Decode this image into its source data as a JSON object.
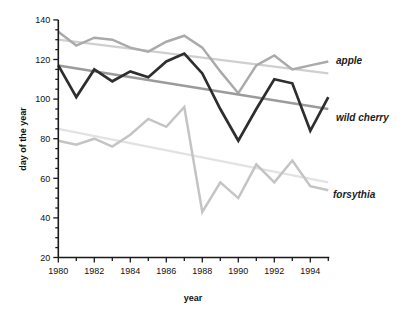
{
  "chart_data": {
    "type": "line",
    "x": [
      1980,
      1981,
      1982,
      1983,
      1984,
      1985,
      1986,
      1987,
      1988,
      1989,
      1990,
      1991,
      1992,
      1993,
      1994,
      1995
    ],
    "x_axis": {
      "label": "year",
      "range": [
        1980,
        1995
      ],
      "minor_tick_step": 1,
      "labeled_ticks": [
        1980,
        1982,
        1984,
        1986,
        1988,
        1990,
        1992,
        1994
      ],
      "tick_labels": [
        "1980",
        "1982",
        "1984",
        "1986",
        "1988",
        "1990",
        "1992",
        "1994"
      ]
    },
    "y_axis": {
      "label": "day of the year",
      "range": [
        20,
        140
      ],
      "major_tick_step": 20,
      "minor_tick_step": 5,
      "labeled_ticks": [
        20,
        40,
        60,
        80,
        100,
        120,
        140
      ],
      "tick_labels": [
        "20",
        "40",
        "60",
        "80",
        "100",
        "120",
        "140"
      ]
    },
    "grid": false,
    "legend_position": "right-of-line-ends",
    "series": [
      {
        "name": "forsythia trendline",
        "role": "trend",
        "color": "#e2e2e2",
        "width": 2.2,
        "endpoints": [
          85,
          58
        ]
      },
      {
        "name": "forsythia",
        "role": "data",
        "color": "#c4c4c4",
        "width": 2.5,
        "values": [
          79,
          77,
          80,
          76,
          82,
          90,
          86,
          96,
          43,
          58,
          50,
          67,
          58,
          69,
          56,
          54
        ]
      },
      {
        "name": "apple trendline",
        "role": "trend",
        "color": "#cfcfcf",
        "width": 2.2,
        "endpoints": [
          130,
          113
        ]
      },
      {
        "name": "apple",
        "role": "data",
        "color": "#aaaaaa",
        "width": 2.5,
        "values": [
          134,
          127,
          131,
          130,
          126,
          124,
          129,
          132,
          126,
          114,
          103,
          117,
          122,
          115,
          117,
          119
        ]
      },
      {
        "name": "wild cherry trendline",
        "role": "trend",
        "color": "#9b9b9b",
        "width": 2.5,
        "endpoints": [
          117,
          95
        ]
      },
      {
        "name": "wild cherry",
        "role": "data",
        "color": "#2e2e2e",
        "width": 2.7,
        "values": [
          117,
          101,
          115,
          109,
          114,
          111,
          119,
          123,
          113,
          95,
          79,
          95,
          110,
          108,
          84,
          101
        ]
      }
    ]
  },
  "labels": {
    "apple": "apple",
    "wild_cherry": "wild cherry",
    "forsythia": "forsythia",
    "x_title": "year",
    "y_title": "day of the year"
  }
}
